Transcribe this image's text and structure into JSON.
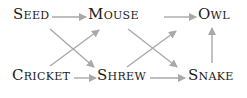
{
  "diagram": {
    "type": "food-web",
    "nodes": [
      {
        "id": "seed",
        "label": "Seed"
      },
      {
        "id": "mouse",
        "label": "Mouse"
      },
      {
        "id": "owl",
        "label": "Owl"
      },
      {
        "id": "cricket",
        "label": "Cricket"
      },
      {
        "id": "shrew",
        "label": "Shrew"
      },
      {
        "id": "snake",
        "label": "Snake"
      }
    ],
    "edges": [
      {
        "from": "seed",
        "to": "mouse"
      },
      {
        "from": "mouse",
        "to": "owl"
      },
      {
        "from": "cricket",
        "to": "shrew"
      },
      {
        "from": "shrew",
        "to": "snake"
      },
      {
        "from": "seed",
        "to": "shrew"
      },
      {
        "from": "cricket",
        "to": "mouse"
      },
      {
        "from": "mouse",
        "to": "snake"
      },
      {
        "from": "shrew",
        "to": "owl"
      },
      {
        "from": "snake",
        "to": "owl"
      }
    ],
    "colors": {
      "text": "#1a1a1a",
      "arrow": "#a9a9a9"
    }
  }
}
